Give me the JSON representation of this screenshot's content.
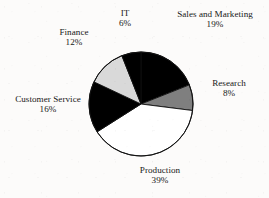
{
  "chart_data": {
    "type": "pie",
    "title": "",
    "subtitle": "",
    "xlabel": "",
    "ylabel": "",
    "grid": false,
    "legend_position": "none",
    "labels_position": "outside",
    "start_angle_deg": 0,
    "direction": "clockwise",
    "categories": [
      "Sales and Marketing",
      "Research",
      "Production",
      "Customer Service",
      "Finance",
      "IT"
    ],
    "values": [
      19,
      8,
      39,
      16,
      12,
      6
    ],
    "value_unit": "%",
    "slices": [
      {
        "label": "Sales and Marketing",
        "value": 19,
        "value_text": "19%",
        "color": "#000000",
        "outline": "#111111"
      },
      {
        "label": "Research",
        "value": 8,
        "value_text": "8%",
        "color": "#7f7f7f",
        "outline": "#111111"
      },
      {
        "label": "Production",
        "value": 39,
        "value_text": "39%",
        "color": "#ffffff",
        "outline": "#111111"
      },
      {
        "label": "Customer Service",
        "value": 16,
        "value_text": "16%",
        "color": "#000000",
        "outline": "#111111"
      },
      {
        "label": "Finance",
        "value": 12,
        "value_text": "12%",
        "color": "#d9d9d9",
        "outline": "#111111"
      },
      {
        "label": "IT",
        "value": 6,
        "value_text": "6%",
        "color": "#000000",
        "outline": "#111111"
      }
    ]
  },
  "figure": {
    "background_color": "#fcfbfa",
    "text_color": "#171717",
    "pie": {
      "center_x": 141,
      "center_y": 104,
      "radius": 52,
      "outline_color": "#111111",
      "outline_width": 0.9
    }
  }
}
